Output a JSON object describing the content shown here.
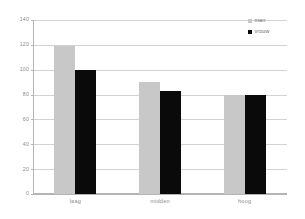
{
  "chart_data": {
    "type": "bar",
    "title": "",
    "subtitle": "",
    "xlabel": "",
    "ylabel": "",
    "categories": [
      "laag",
      "midden",
      "hoog"
    ],
    "series": [
      {
        "name": "man",
        "color": "#c8c8c8",
        "values": [
          119,
          90,
          80
        ]
      },
      {
        "name": "vrouw",
        "color": "#0a0a0a",
        "values": [
          100,
          83,
          80
        ]
      }
    ],
    "ylim": [
      0,
      140
    ],
    "yticks": [
      0,
      20,
      40,
      60,
      80,
      100,
      120,
      140
    ],
    "ytick_labels": [
      "0",
      "20",
      "40",
      "60",
      "80",
      "100",
      "120",
      "140"
    ],
    "grid": true,
    "grid_axis": "y",
    "legend_position": "top-right",
    "legend": [
      "man",
      "vrouw"
    ],
    "annotations": []
  },
  "colors": {
    "series_man": "#c8c8c8",
    "series_vrouw": "#0a0a0a",
    "gridline": "#d2d2d2",
    "axis": "#b4b4b4",
    "tick_text": "#8c8c8c",
    "legend_text": "#6e6e6e",
    "background": "#ffffff"
  }
}
